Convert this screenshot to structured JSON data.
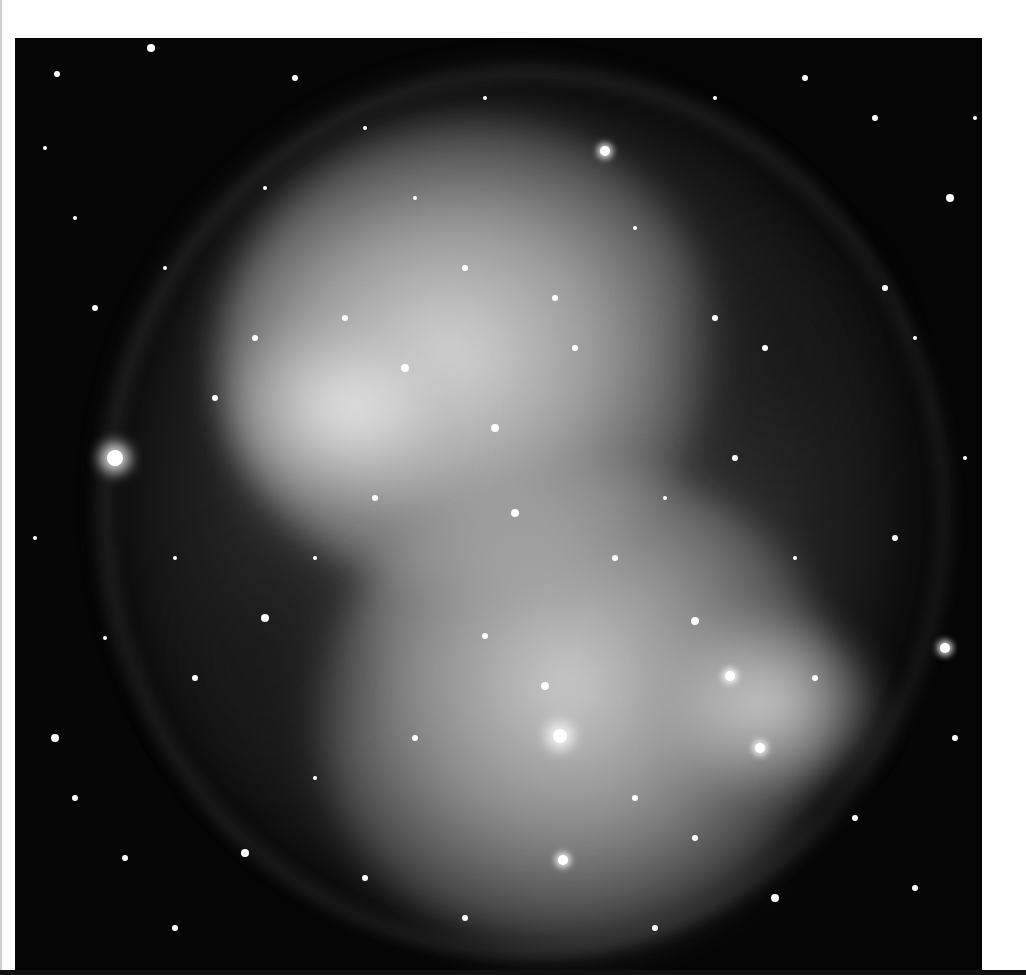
{
  "image": {
    "subject": "Planetary nebula (Dumbbell-shaped) in grayscale with dense star field",
    "colors": {
      "background_page": "#ffffff",
      "sky": "#050505",
      "nebula_core": "#e0e0e0",
      "nebula_mid": "#9a9a9a",
      "stars": "#ffffff"
    }
  },
  "stars": [
    {
      "x": 42,
      "y": 36,
      "r": 3
    },
    {
      "x": 136,
      "y": 10,
      "r": 4
    },
    {
      "x": 280,
      "y": 40,
      "r": 3
    },
    {
      "x": 590,
      "y": 113,
      "r": 5,
      "glow": true
    },
    {
      "x": 935,
      "y": 160,
      "r": 4
    },
    {
      "x": 30,
      "y": 110,
      "r": 2
    },
    {
      "x": 60,
      "y": 180,
      "r": 2
    },
    {
      "x": 80,
      "y": 270,
      "r": 3
    },
    {
      "x": 150,
      "y": 230,
      "r": 2
    },
    {
      "x": 250,
      "y": 150,
      "r": 2
    },
    {
      "x": 790,
      "y": 40,
      "r": 3
    },
    {
      "x": 860,
      "y": 80,
      "r": 3
    },
    {
      "x": 870,
      "y": 250,
      "r": 3
    },
    {
      "x": 900,
      "y": 300,
      "r": 2
    },
    {
      "x": 100,
      "y": 420,
      "r": 8,
      "big": true
    },
    {
      "x": 240,
      "y": 300,
      "r": 3
    },
    {
      "x": 330,
      "y": 280,
      "r": 3
    },
    {
      "x": 390,
      "y": 330,
      "r": 4
    },
    {
      "x": 480,
      "y": 390,
      "r": 4
    },
    {
      "x": 500,
      "y": 475,
      "r": 4
    },
    {
      "x": 400,
      "y": 160,
      "r": 2
    },
    {
      "x": 450,
      "y": 230,
      "r": 3
    },
    {
      "x": 540,
      "y": 260,
      "r": 3
    },
    {
      "x": 560,
      "y": 310,
      "r": 3
    },
    {
      "x": 620,
      "y": 190,
      "r": 2
    },
    {
      "x": 700,
      "y": 280,
      "r": 3
    },
    {
      "x": 750,
      "y": 310,
      "r": 3
    },
    {
      "x": 250,
      "y": 580,
      "r": 4
    },
    {
      "x": 180,
      "y": 640,
      "r": 3
    },
    {
      "x": 40,
      "y": 700,
      "r": 4
    },
    {
      "x": 60,
      "y": 760,
      "r": 3
    },
    {
      "x": 110,
      "y": 820,
      "r": 3
    },
    {
      "x": 230,
      "y": 815,
      "r": 4
    },
    {
      "x": 160,
      "y": 890,
      "r": 3
    },
    {
      "x": 545,
      "y": 698,
      "r": 7,
      "big": true
    },
    {
      "x": 530,
      "y": 648,
      "r": 4
    },
    {
      "x": 470,
      "y": 598,
      "r": 3
    },
    {
      "x": 680,
      "y": 583,
      "r": 4
    },
    {
      "x": 715,
      "y": 638,
      "r": 5,
      "glow": true
    },
    {
      "x": 745,
      "y": 710,
      "r": 5,
      "glow": true
    },
    {
      "x": 548,
      "y": 822,
      "r": 5,
      "glow": true
    },
    {
      "x": 800,
      "y": 640,
      "r": 3
    },
    {
      "x": 930,
      "y": 610,
      "r": 5,
      "glow": true
    },
    {
      "x": 880,
      "y": 500,
      "r": 3
    },
    {
      "x": 840,
      "y": 780,
      "r": 3
    },
    {
      "x": 900,
      "y": 850,
      "r": 3
    },
    {
      "x": 760,
      "y": 860,
      "r": 4
    },
    {
      "x": 640,
      "y": 890,
      "r": 3
    },
    {
      "x": 450,
      "y": 880,
      "r": 3
    },
    {
      "x": 350,
      "y": 840,
      "r": 3
    },
    {
      "x": 300,
      "y": 740,
      "r": 2
    },
    {
      "x": 400,
      "y": 700,
      "r": 3
    },
    {
      "x": 620,
      "y": 760,
      "r": 3
    },
    {
      "x": 680,
      "y": 800,
      "r": 3
    },
    {
      "x": 360,
      "y": 460,
      "r": 3
    },
    {
      "x": 300,
      "y": 520,
      "r": 2
    },
    {
      "x": 600,
      "y": 520,
      "r": 3
    },
    {
      "x": 650,
      "y": 460,
      "r": 2
    },
    {
      "x": 720,
      "y": 420,
      "r": 3
    },
    {
      "x": 780,
      "y": 520,
      "r": 2
    },
    {
      "x": 200,
      "y": 360,
      "r": 3
    },
    {
      "x": 160,
      "y": 520,
      "r": 2
    },
    {
      "x": 90,
      "y": 600,
      "r": 2
    },
    {
      "x": 20,
      "y": 500,
      "r": 2
    },
    {
      "x": 950,
      "y": 420,
      "r": 2
    },
    {
      "x": 940,
      "y": 700,
      "r": 3
    },
    {
      "x": 960,
      "y": 80,
      "r": 2
    },
    {
      "x": 700,
      "y": 60,
      "r": 2
    },
    {
      "x": 470,
      "y": 60,
      "r": 2
    },
    {
      "x": 350,
      "y": 90,
      "r": 2
    }
  ]
}
